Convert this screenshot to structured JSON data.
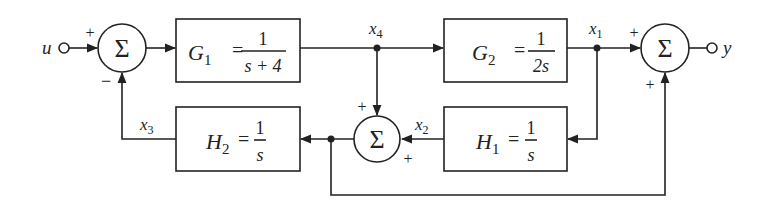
{
  "diagram": {
    "type": "control-system block diagram",
    "input_label": "u",
    "output_label": "y",
    "summing_symbol": "Σ",
    "blocks": {
      "G1": {
        "name": "G",
        "sub": "1",
        "eq": "=",
        "num": "1",
        "den": "s + 4"
      },
      "G2": {
        "name": "G",
        "sub": "2",
        "eq": "=",
        "num": "1",
        "den": "2s"
      },
      "H1": {
        "name": "H",
        "sub": "1",
        "eq": "=",
        "num": "1",
        "den": "s"
      },
      "H2": {
        "name": "H",
        "sub": "2",
        "eq": "=",
        "num": "1",
        "den": "s"
      }
    },
    "signals": {
      "x1": {
        "name": "x",
        "sub": "1"
      },
      "x2": {
        "name": "x",
        "sub": "2"
      },
      "x3": {
        "name": "x",
        "sub": "3"
      },
      "x4": {
        "name": "x",
        "sub": "4"
      }
    },
    "summing_junctions": {
      "sum1": {
        "sign_left": "+",
        "sign_bottom": "−"
      },
      "sum2": {
        "sign_top": "+",
        "sign_right": "+"
      },
      "sum3": {
        "sign_left": "+",
        "sign_bottom": "+"
      }
    }
  }
}
